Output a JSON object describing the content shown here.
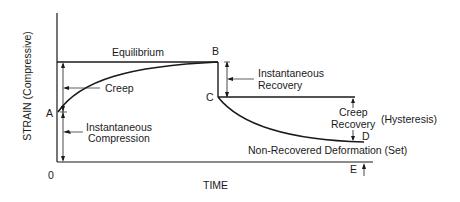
{
  "diagram": {
    "axes": {
      "y_label": "STRAIN (Compressive)",
      "x_label": "TIME",
      "origin_label": "0"
    },
    "points": {
      "A": "A",
      "B": "B",
      "C": "C",
      "D": "D",
      "E": "E"
    },
    "annotations": {
      "equilibrium": "Equilibrium",
      "creep": "Creep",
      "instantaneous_compression_line1": "Instantaneous",
      "instantaneous_compression_line2": "Compression",
      "instantaneous_recovery_line1": "Instantaneous",
      "instantaneous_recovery_line2": "Recovery",
      "creep_recovery_line1": "Creep",
      "creep_recovery_line2": "Recovery",
      "hysteresis": "(Hysteresis)",
      "non_recovered": "Non-Recovered Deformation (Set)"
    },
    "colors": {
      "line": "#1a1a1a",
      "background": "#ffffff"
    }
  }
}
